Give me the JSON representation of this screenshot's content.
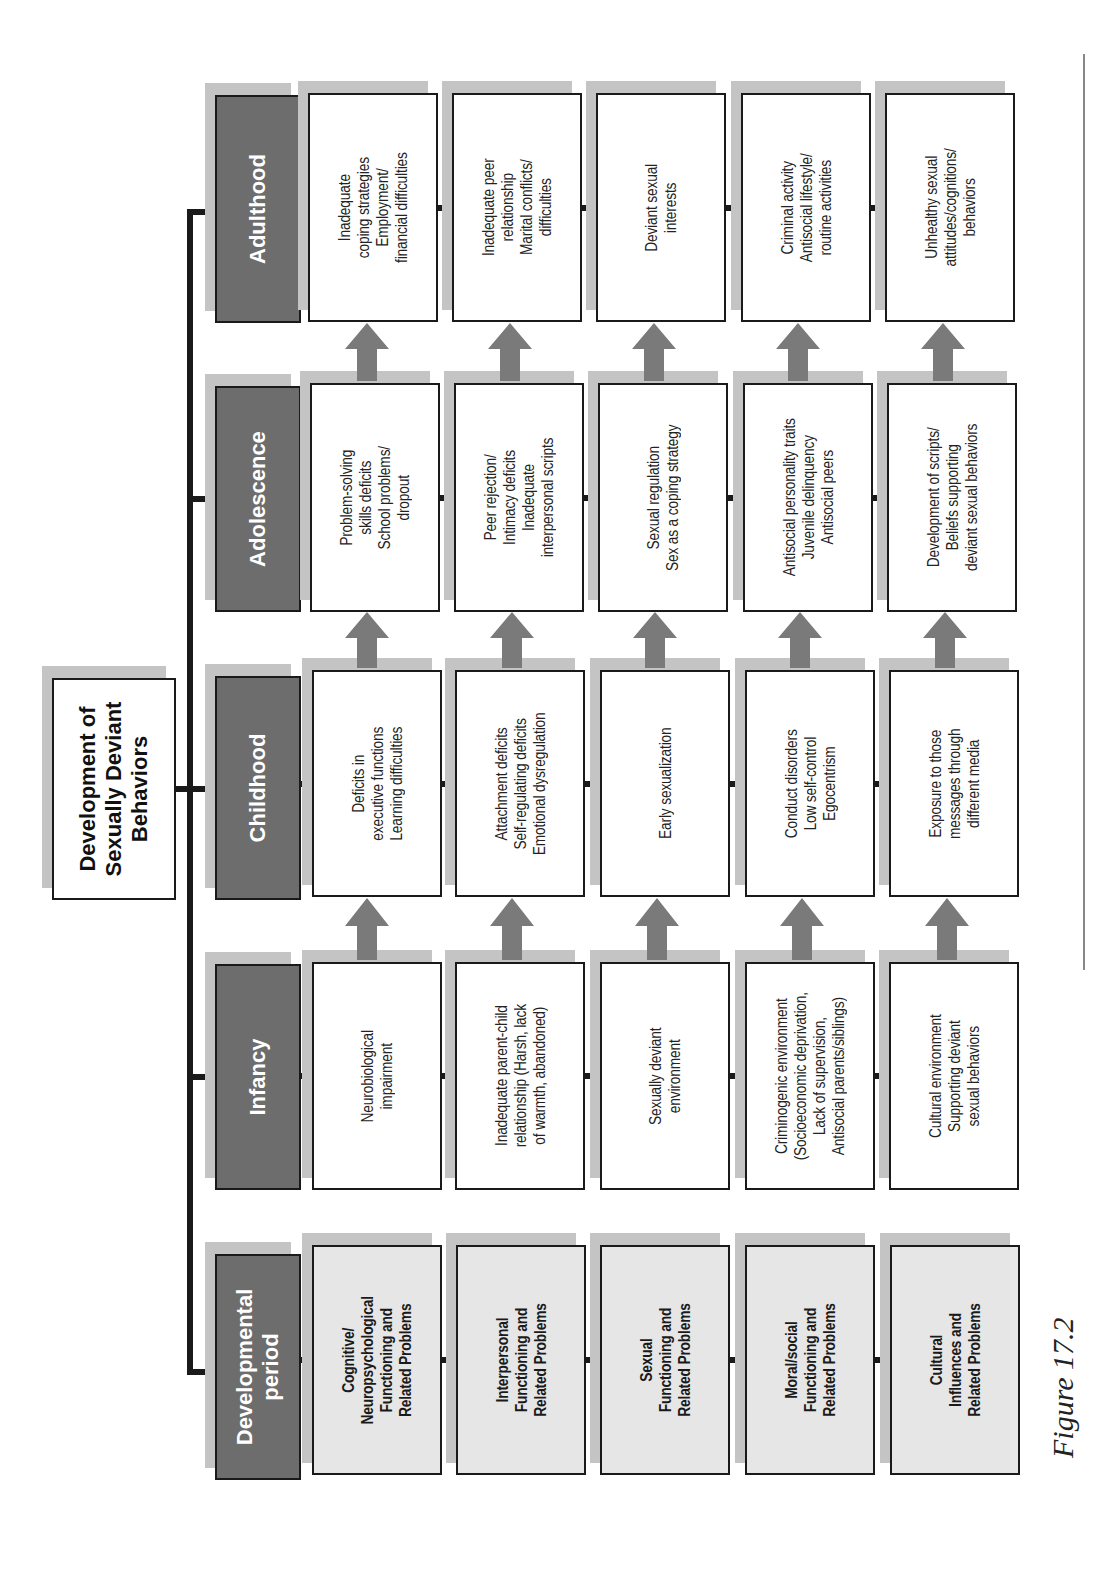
{
  "title": "Development of\nSexually Deviant\nBehaviors",
  "caption": "Figure 17.2",
  "colors": {
    "header_fill": "#6d6d6d",
    "domain_fill": "#e6e6e6",
    "cell_fill": "#ffffff",
    "shadow": "#c4c4c4",
    "arrow": "#7a7a7a",
    "line": "#1a1a1a"
  },
  "headers": [
    {
      "label": "Developmental\nperiod"
    },
    {
      "label": "Infancy"
    },
    {
      "label": "Childhood"
    },
    {
      "label": "Adolescence"
    },
    {
      "label": "Adulthood"
    }
  ],
  "rows": [
    {
      "domain": "Cognitive/\nNeuropsychological\nFunctioning and\nRelated Problems",
      "cells": [
        "Neurobiological\nimpairment",
        "Deficits in\nexecutive functions\nLearning difficulties",
        "Problem-solving\nskills deficits\nSchool problems/\ndropout",
        "Inadequate\ncoping strategies\nEmployment/\nfinancial difficulties"
      ]
    },
    {
      "domain": "Interpersonal\nFunctioning and\nRelated Problems",
      "cells": [
        "Inadequate parent-child\nrelationship (Harsh, lack\nof warmth, abandoned)",
        "Attachment deficits\nSelf-regulating deficits\nEmotional dysregulation",
        "Peer rejection/\nIntimacy deficits\nInadequate\ninterpersonal scripts",
        "Inadequate peer\nrelationship\nMarital conflicts/\ndifficulties"
      ]
    },
    {
      "domain": "Sexual\nFunctioning and\nRelated Problems",
      "cells": [
        "Sexually deviant\nenvironment",
        "Early sexualization",
        "Sexual regulation\nSex as a coping strategy",
        "Deviant sexual\ninterests"
      ]
    },
    {
      "domain": "Moral/social\nFunctioning and\nRelated Problems",
      "cells": [
        "Criminogenic environment\n(Socioeconomic deprivation,\nLack of supervision,\nAntisocial parents/siblings)",
        "Conduct disorders\nLow self-control\nEgocentrism",
        "Antisocial personality traits\nJuvenile delinquency\nAntisocial peers",
        "Criminal activity\nAntisocial lifestyle/\nroutine activities"
      ]
    },
    {
      "domain": "Cultural\nInfluences and\nRelated Problems",
      "cells": [
        "Cultural environment\nSupporting deviant\nsexual behaviors",
        "Exposure to those\nmessages through\ndifferent media",
        "Development of scripts/\nBeliefs supporting\ndeviant sexual behaviors",
        "Unhealthy sexual\nattitudes/cognitions/\nbehaviors"
      ]
    }
  ]
}
